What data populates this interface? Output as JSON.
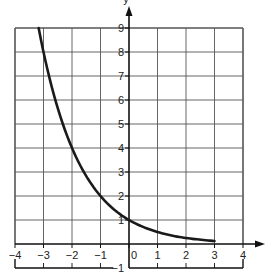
{
  "chart_data": {
    "type": "line",
    "title": "",
    "xlabel": "x",
    "ylabel": "y",
    "xlim": [
      -4,
      4
    ],
    "ylim": [
      -1,
      9
    ],
    "grid": true,
    "x_ticks": [
      -4,
      -3,
      -2,
      -1,
      0,
      1,
      2,
      3,
      4
    ],
    "x_tick_labels": [
      "−4",
      "−3",
      "−2",
      "−1",
      "0",
      "1",
      "2",
      "3",
      "4"
    ],
    "y_ticks": [
      -1,
      1,
      2,
      3,
      4,
      5,
      6,
      7,
      8,
      9
    ],
    "y_tick_labels": [
      "−1",
      "1",
      "2",
      "3",
      "4",
      "5",
      "6",
      "7",
      "8",
      "9"
    ],
    "series": [
      {
        "name": "y = (1/2)^x",
        "x": [
          -3.17,
          -3,
          -2.5,
          -2,
          -1.5,
          -1,
          -0.5,
          0,
          0.5,
          1,
          1.5,
          2,
          2.5,
          3
        ],
        "y": [
          9,
          8,
          5.66,
          4,
          2.83,
          2,
          1.41,
          1,
          0.71,
          0.5,
          0.35,
          0.25,
          0.18,
          0.125
        ]
      }
    ],
    "colors": {
      "curve": "#1a1a1a",
      "grid": "#555555",
      "axis": "#111111"
    }
  }
}
